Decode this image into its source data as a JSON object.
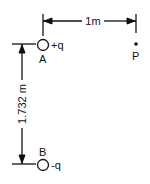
{
  "diagram": {
    "horizontal_dimension": {
      "label": "1m"
    },
    "vertical_dimension": {
      "label": "1.732 m"
    },
    "charge_a": {
      "label": "A",
      "charge": "+q"
    },
    "charge_b": {
      "label": "B",
      "charge": "-q"
    },
    "point_p": {
      "label": "P"
    },
    "colors": {
      "ink": "#111111",
      "background": "#ffffff"
    }
  }
}
